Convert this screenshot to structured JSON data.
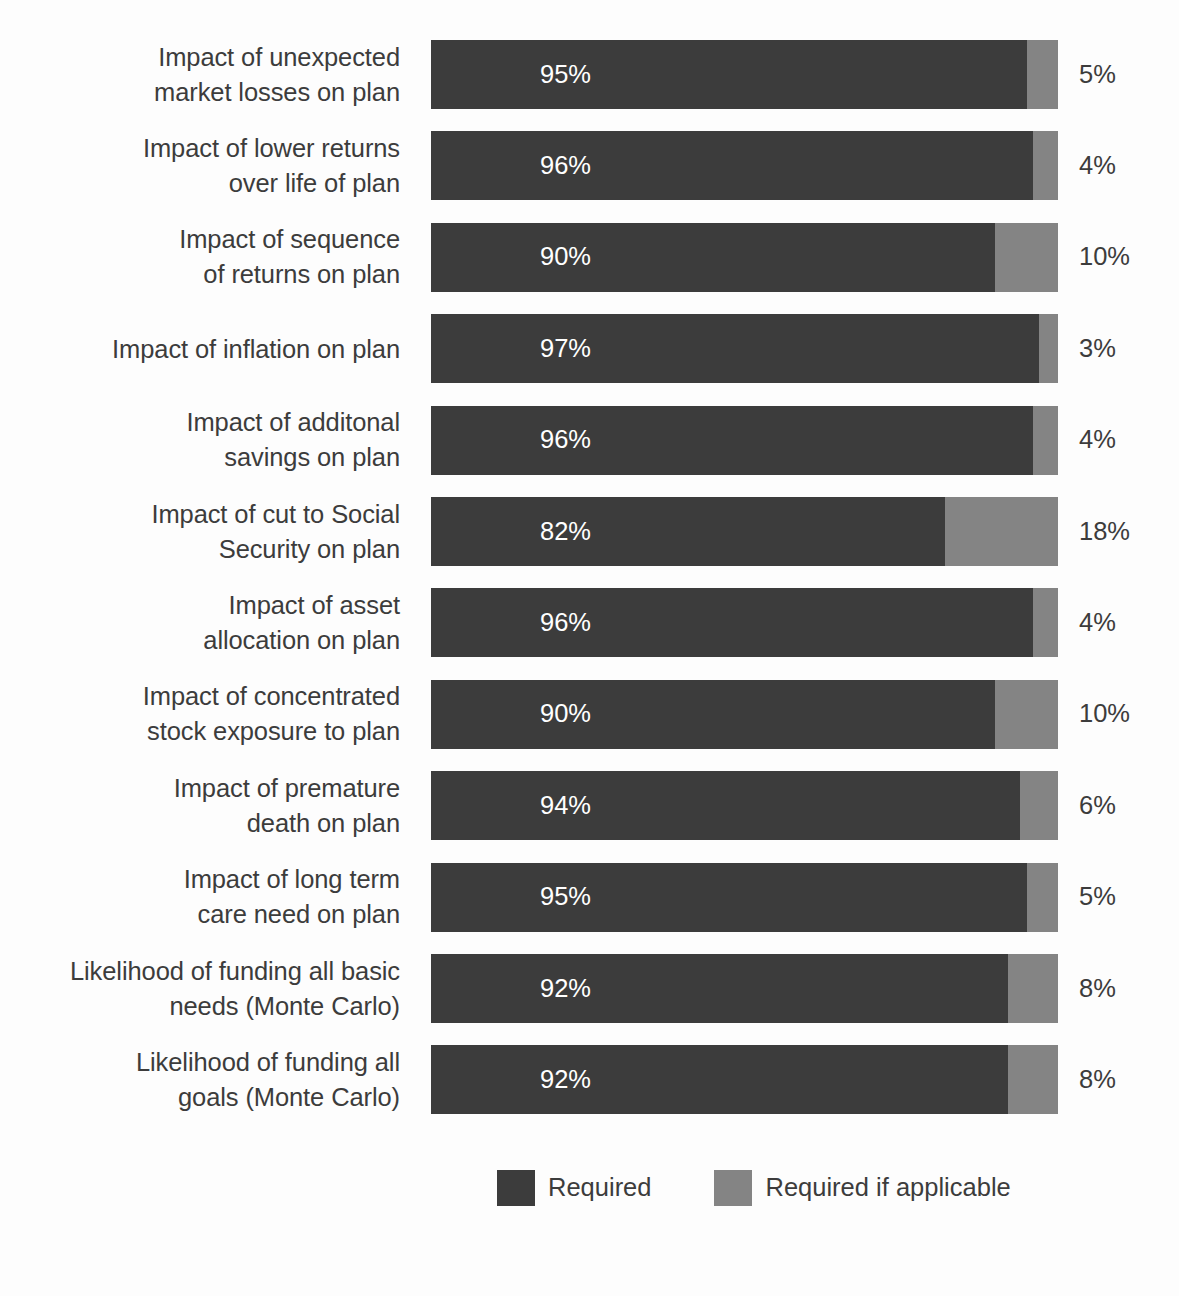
{
  "chart_data": {
    "type": "bar",
    "orientation": "horizontal",
    "stacked": true,
    "title": "",
    "subtitle": "",
    "xlabel": "",
    "ylabel": "",
    "xlim": [
      0,
      100
    ],
    "grid": false,
    "legend_position": "bottom",
    "value_suffix": "%",
    "colors": {
      "primary": "#3c3c3c",
      "secondary": "#848484",
      "background": "#fdfdfd",
      "text": "#3c3c3c",
      "inbar_text": "#ffffff"
    },
    "categories": [
      "Impact of unexpected\nmarket losses on plan",
      "Impact of lower returns\nover life of plan",
      "Impact of sequence\nof returns on plan",
      "Impact of inflation on plan",
      "Impact of additonal\nsavings on plan",
      "Impact of cut to Social\nSecurity on plan",
      "Impact of asset\nallocation on plan",
      "Impact of concentrated\nstock exposure to plan",
      "Impact of premature\ndeath on plan",
      "Impact of long term\ncare need on plan",
      "Likelihood of funding all basic\nneeds (Monte Carlo)",
      "Likelihood of funding all\ngoals (Monte Carlo)"
    ],
    "series": [
      {
        "name": "Required",
        "color": "#3c3c3c",
        "values": [
          95,
          96,
          90,
          97,
          96,
          82,
          96,
          90,
          94,
          95,
          92,
          92
        ],
        "labels": [
          "95%",
          "96%",
          "90%",
          "97%",
          "96%",
          "82%",
          "96%",
          "90%",
          "94%",
          "95%",
          "92%",
          "92%"
        ]
      },
      {
        "name": "Required if applicable",
        "color": "#848484",
        "values": [
          5,
          4,
          10,
          3,
          4,
          18,
          4,
          10,
          6,
          5,
          8,
          8
        ],
        "labels": [
          "5%",
          "4%",
          "10%",
          "3%",
          "4%",
          "18%",
          "4%",
          "10%",
          "6%",
          "5%",
          "8%",
          "8%"
        ]
      }
    ]
  },
  "rows": [
    {
      "label": "Impact of unexpected\nmarket losses on plan",
      "primary": 95,
      "secondary": 5,
      "primary_label": "95%",
      "secondary_label": "5%"
    },
    {
      "label": "Impact of lower returns\nover life of plan",
      "primary": 96,
      "secondary": 4,
      "primary_label": "96%",
      "secondary_label": "4%"
    },
    {
      "label": "Impact of sequence\nof returns on plan",
      "primary": 90,
      "secondary": 10,
      "primary_label": "90%",
      "secondary_label": "10%"
    },
    {
      "label": "Impact of inflation on plan",
      "primary": 97,
      "secondary": 3,
      "primary_label": "97%",
      "secondary_label": "3%"
    },
    {
      "label": "Impact of additonal\nsavings on plan",
      "primary": 96,
      "secondary": 4,
      "primary_label": "96%",
      "secondary_label": "4%"
    },
    {
      "label": "Impact of cut to Social\nSecurity on plan",
      "primary": 82,
      "secondary": 18,
      "primary_label": "82%",
      "secondary_label": "18%"
    },
    {
      "label": "Impact of asset\nallocation on plan",
      "primary": 96,
      "secondary": 4,
      "primary_label": "96%",
      "secondary_label": "4%"
    },
    {
      "label": "Impact of concentrated\nstock exposure to plan",
      "primary": 90,
      "secondary": 10,
      "primary_label": "90%",
      "secondary_label": "10%"
    },
    {
      "label": "Impact of premature\ndeath on plan",
      "primary": 94,
      "secondary": 6,
      "primary_label": "94%",
      "secondary_label": "6%"
    },
    {
      "label": "Impact of long term\ncare need on plan",
      "primary": 95,
      "secondary": 5,
      "primary_label": "95%",
      "secondary_label": "5%"
    },
    {
      "label": "Likelihood of funding all basic\nneeds (Monte Carlo)",
      "primary": 92,
      "secondary": 8,
      "primary_label": "92%",
      "secondary_label": "8%"
    },
    {
      "label": "Likelihood of funding all\ngoals (Monte Carlo)",
      "primary": 92,
      "secondary": 8,
      "primary_label": "92%",
      "secondary_label": "8%"
    }
  ],
  "legend": {
    "items": [
      {
        "label": "Required",
        "color": "#3c3c3c"
      },
      {
        "label": "Required if applicable",
        "color": "#848484"
      }
    ]
  },
  "layout": {
    "row_top_start": 40,
    "row_pitch": 91.4,
    "bar_height": 69,
    "bar_left": 431,
    "bar_width": 627
  }
}
